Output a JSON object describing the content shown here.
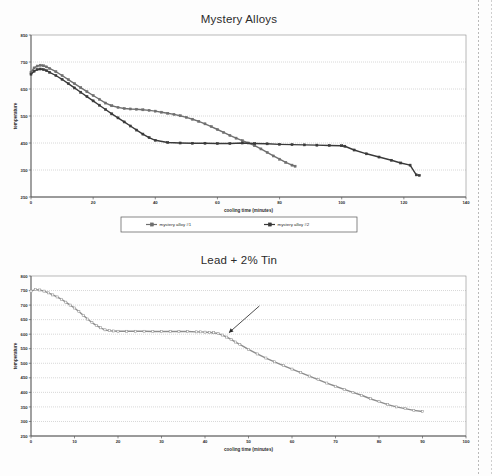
{
  "page": {
    "background": "#fdfdfd",
    "scan_edge_color": "#b9b9b9"
  },
  "charts": [
    {
      "id": "chart1",
      "title": "Mystery Alloys",
      "xlabel": "cooling time (minutes)",
      "ylabel": "temperature",
      "legend_position": "bottom",
      "has_legend": true
    },
    {
      "id": "chart2",
      "title": "Lead + 2% Tin",
      "xlabel": "cooling time (minutes)",
      "ylabel": "temperature",
      "legend_position": "none",
      "has_legend": false,
      "annotation": "arrow"
    }
  ],
  "chart_data": [
    {
      "type": "line",
      "title": "Mystery Alloys",
      "xlabel": "cooling time (minutes)",
      "ylabel": "temperature",
      "xlim": [
        0,
        140
      ],
      "ylim": [
        250,
        850
      ],
      "xticks": [
        0,
        20,
        40,
        60,
        80,
        100,
        120,
        140
      ],
      "yticks": [
        250,
        350,
        450,
        550,
        650,
        750,
        850
      ],
      "grid": true,
      "legend": [
        "mystery alloy #1",
        "mystery alloy #2"
      ],
      "series": [
        {
          "name": "mystery alloy #1",
          "color": "#6f6f6f",
          "marker": "square",
          "x": [
            0,
            1,
            2,
            3,
            4,
            5,
            6,
            8,
            10,
            12,
            14,
            16,
            18,
            20,
            22,
            24,
            26,
            28,
            30,
            32,
            34,
            36,
            38,
            40,
            42,
            44,
            46,
            48,
            50,
            52,
            54,
            56,
            58,
            60,
            62,
            64,
            66,
            68,
            70,
            72,
            74,
            76,
            78,
            80,
            82,
            84,
            85
          ],
          "y": [
            712,
            728,
            735,
            738,
            736,
            732,
            726,
            714,
            700,
            685,
            670,
            655,
            640,
            626,
            612,
            598,
            588,
            582,
            578,
            576,
            575,
            573,
            571,
            568,
            564,
            560,
            556,
            551,
            545,
            538,
            530,
            521,
            511,
            500,
            489,
            478,
            468,
            459,
            450,
            440,
            428,
            415,
            402,
            390,
            378,
            368,
            364
          ]
        },
        {
          "name": "mystery alloy #2",
          "color": "#3a3a3a",
          "marker": "square",
          "x": [
            0,
            1,
            2,
            3,
            4,
            5,
            6,
            8,
            10,
            12,
            14,
            16,
            18,
            20,
            22,
            24,
            26,
            28,
            30,
            32,
            34,
            36,
            38,
            40,
            44,
            48,
            52,
            56,
            60,
            64,
            68,
            72,
            76,
            80,
            84,
            88,
            92,
            96,
            100,
            101,
            104,
            108,
            112,
            116,
            119,
            122,
            124,
            125
          ],
          "y": [
            705,
            716,
            722,
            724,
            722,
            718,
            712,
            700,
            686,
            670,
            654,
            638,
            622,
            606,
            590,
            574,
            558,
            543,
            528,
            513,
            498,
            483,
            470,
            460,
            452,
            450,
            449,
            449,
            448,
            448,
            450,
            448,
            447,
            445,
            444,
            443,
            442,
            441,
            440,
            438,
            424,
            410,
            398,
            386,
            376,
            368,
            332,
            330
          ]
        }
      ]
    },
    {
      "type": "line",
      "title": "Lead + 2% Tin",
      "xlabel": "cooling time (minutes)",
      "ylabel": "temperature",
      "xlim": [
        0,
        100
      ],
      "ylim": [
        250,
        800
      ],
      "xticks": [
        0,
        10,
        20,
        30,
        40,
        50,
        60,
        70,
        80,
        90,
        100
      ],
      "yticks": [
        250,
        300,
        350,
        400,
        450,
        500,
        550,
        600,
        650,
        700,
        750,
        800
      ],
      "grid": true,
      "annotation": {
        "type": "arrow",
        "x": 45.5,
        "y": 605,
        "tail_x": 52.5,
        "tail_y": 697
      },
      "series": [
        {
          "name": "Lead + 2% Tin",
          "color": "#8e8e8e",
          "marker": "square-open",
          "x": [
            0,
            1,
            2,
            3,
            4,
            5,
            6,
            7,
            8,
            9,
            10,
            11,
            12,
            13,
            14,
            15,
            16,
            17,
            18,
            19,
            20,
            22,
            24,
            26,
            28,
            30,
            32,
            34,
            36,
            38,
            39,
            40,
            41,
            42,
            43,
            44,
            45,
            46,
            47,
            48,
            50,
            52,
            54,
            56,
            58,
            60,
            62,
            64,
            66,
            68,
            70,
            72,
            74,
            76,
            78,
            80,
            82,
            84,
            86,
            88,
            90
          ],
          "y": [
            748,
            753,
            752,
            748,
            742,
            735,
            728,
            720,
            710,
            700,
            690,
            678,
            665,
            652,
            640,
            630,
            622,
            615,
            612,
            611,
            610,
            610,
            610,
            610,
            609,
            609,
            609,
            609,
            609,
            608,
            608,
            607,
            606,
            605,
            602,
            597,
            590,
            582,
            573,
            565,
            548,
            532,
            518,
            505,
            492,
            480,
            468,
            456,
            444,
            432,
            421,
            410,
            400,
            390,
            378,
            368,
            358,
            350,
            344,
            338,
            334
          ]
        }
      ]
    }
  ]
}
